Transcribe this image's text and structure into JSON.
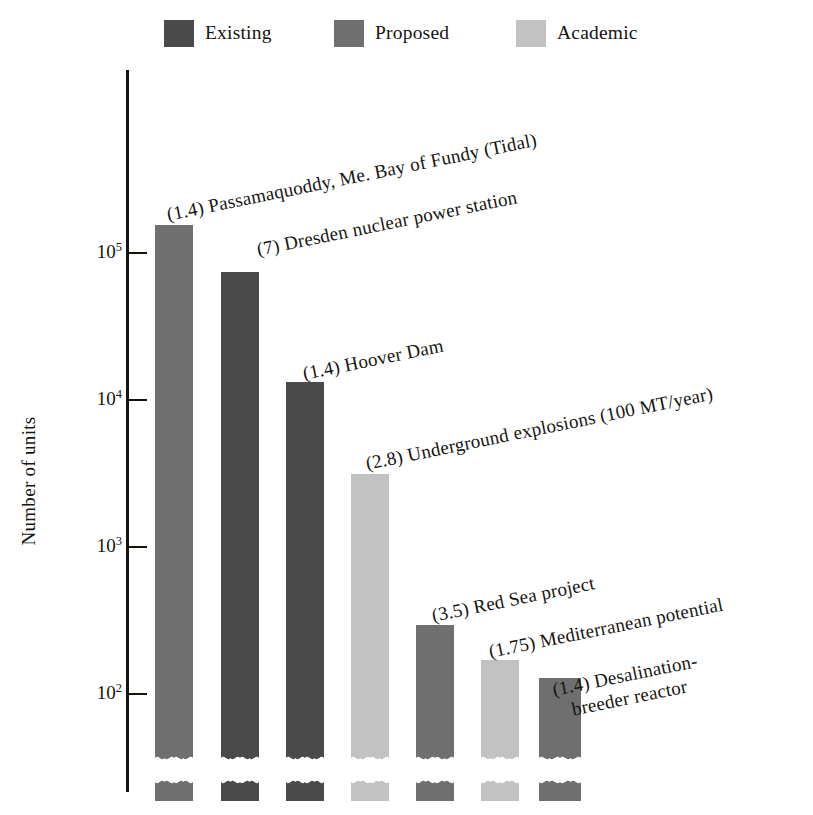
{
  "legend": {
    "items": [
      {
        "label": "Existing",
        "key": "existing",
        "color": "#4a4a4a"
      },
      {
        "label": "Proposed",
        "key": "proposed",
        "color": "#6f6f6f"
      },
      {
        "label": "Academic",
        "key": "academic",
        "color": "#c2c2c2"
      }
    ]
  },
  "axis": {
    "y_title": "Number of units",
    "ticks": [
      {
        "label": "10",
        "exp": "5"
      },
      {
        "label": "10",
        "exp": "4"
      },
      {
        "label": "10",
        "exp": "3"
      },
      {
        "label": "10",
        "exp": "2"
      }
    ]
  },
  "annotations": [
    {
      "text": "(1.4) Passamaquoddy, Me. Bay of Fundy (Tidal)",
      "line2": ""
    },
    {
      "text": "(7) Dresden nuclear power station",
      "line2": ""
    },
    {
      "text": "(1.4) Hoover Dam",
      "line2": ""
    },
    {
      "text": "(2.8) Underground explosions (100 MT/year)",
      "line2": ""
    },
    {
      "text": "(3.5) Red Sea project",
      "line2": ""
    },
    {
      "text": "(1.75) Mediterranean potential",
      "line2": ""
    },
    {
      "text": "(1.4) Desalination-",
      "line2": "breeder  reactor"
    }
  ],
  "chart_data": {
    "type": "bar",
    "title": "",
    "subtitle": "",
    "xlabel": "",
    "ylabel": "Number of units",
    "yscale": "log",
    "ylim": [
      30,
      400000
    ],
    "ytick_values": [
      100,
      1000,
      10000,
      100000
    ],
    "ytick_labels": [
      "10^2",
      "10^3",
      "10^4",
      "10^5"
    ],
    "grid": false,
    "legend_position": "top",
    "axis_break": true,
    "axis_break_note": "Each bar is drawn with a wavy break near the baseline; a short stub segment sits below the break.",
    "categories": [
      "(1.4) Passamaquoddy, Me. Bay of Fundy (Tidal)",
      "(7) Dresden nuclear power station",
      "(1.4) Hoover Dam",
      "(2.8) Underground explosions (100 MT/year)",
      "(3.5) Red Sea project",
      "(1.75) Mediterranean potential",
      "(1.4) Desalination-breeder  reactor"
    ],
    "values": [
      150000,
      75000,
      13000,
      3100,
      300,
      170,
      130
    ],
    "series_key": [
      "proposed",
      "existing",
      "existing",
      "academic",
      "proposed",
      "academic",
      "proposed"
    ],
    "series": [
      {
        "name": "Existing",
        "color": "#4a4a4a",
        "points": [
          {
            "category": "(7) Dresden nuclear power station",
            "value": 75000
          },
          {
            "category": "(1.4) Hoover Dam",
            "value": 13000
          }
        ]
      },
      {
        "name": "Proposed",
        "color": "#6f6f6f",
        "points": [
          {
            "category": "(1.4) Passamaquoddy, Me. Bay of Fundy (Tidal)",
            "value": 150000
          },
          {
            "category": "(3.5) Red Sea project",
            "value": 300
          },
          {
            "category": "(1.4) Desalination-breeder  reactor",
            "value": 130
          }
        ]
      },
      {
        "name": "Academic",
        "color": "#c2c2c2",
        "points": [
          {
            "category": "(2.8) Underground explosions (100 MT/year)",
            "value": 3100
          },
          {
            "category": "(1.75) Mediterranean potential",
            "value": 170
          }
        ]
      }
    ],
    "annotation_prefixes": [
      "1.4",
      "7",
      "1.4",
      "2.8",
      "3.5",
      "1.75",
      "1.4"
    ]
  },
  "_layout": {
    "bars": [
      {
        "x": 155,
        "w": 38,
        "top": 225,
        "key": "proposed"
      },
      {
        "x": 221,
        "w": 38,
        "top": 272,
        "key": "existing"
      },
      {
        "x": 286,
        "w": 38,
        "top": 382,
        "key": "existing"
      },
      {
        "x": 351,
        "w": 38,
        "top": 474,
        "key": "academic"
      },
      {
        "x": 416,
        "w": 38,
        "top": 625,
        "key": "proposed"
      },
      {
        "x": 481,
        "w": 38,
        "top": 660,
        "key": "academic"
      },
      {
        "x": 539,
        "w": 42,
        "top": 678,
        "key": "proposed"
      }
    ],
    "break_y": 762,
    "stub_top": 778,
    "stub_bottom": 801,
    "ticks_y": [
      253,
      400,
      547,
      694
    ],
    "annots": [
      {
        "x": 167,
        "y": 203,
        "rot": -11.5
      },
      {
        "x": 257,
        "y": 238,
        "rot": -11.5
      },
      {
        "x": 303,
        "y": 362,
        "rot": -11.5
      },
      {
        "x": 366,
        "y": 452,
        "rot": -11.5
      },
      {
        "x": 432,
        "y": 604,
        "rot": -11.5
      },
      {
        "x": 489,
        "y": 640,
        "rot": -11.5
      },
      {
        "x": 555,
        "y": 678,
        "rot": -11.5
      }
    ]
  }
}
